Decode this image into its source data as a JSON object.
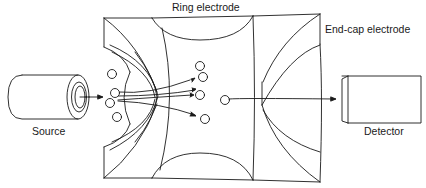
{
  "diagram": {
    "labels": {
      "ring_electrode": "Ring electrode",
      "end_cap_electrode": "End-cap electrode",
      "source": "Source",
      "detector": "Detector"
    },
    "components": [
      {
        "id": "source",
        "shape": "cylinder",
        "label": "Source"
      },
      {
        "id": "entrance-end-cap",
        "shape": "end-cap-electrode"
      },
      {
        "id": "ring-electrode",
        "shape": "ring-electrode",
        "label": "Ring electrode"
      },
      {
        "id": "exit-end-cap",
        "shape": "end-cap-electrode",
        "label": "End-cap electrode"
      },
      {
        "id": "detector",
        "shape": "box",
        "label": "Detector"
      }
    ],
    "ions": {
      "entering_count": 4,
      "trapped_count": 4,
      "ejected_count": 1
    },
    "colors": {
      "line": "#1a1a1a",
      "background": "#ffffff"
    }
  }
}
